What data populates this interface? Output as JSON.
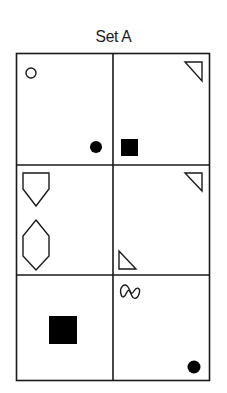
{
  "title": "Set A",
  "grid": {
    "rows": 3,
    "cols": 2,
    "cells": [
      {
        "row": 1,
        "col": 1,
        "shapes": [
          {
            "type": "circle",
            "fill": "outline",
            "position": "top-left"
          },
          {
            "type": "circle",
            "fill": "filled",
            "position": "bottom-right"
          }
        ]
      },
      {
        "row": 1,
        "col": 2,
        "shapes": [
          {
            "type": "right-triangle",
            "fill": "outline",
            "position": "top-right"
          },
          {
            "type": "square",
            "fill": "filled",
            "position": "bottom-left"
          }
        ]
      },
      {
        "row": 2,
        "col": 1,
        "shapes": [
          {
            "type": "pentagon",
            "fill": "outline",
            "position": "top-left"
          },
          {
            "type": "hexagon",
            "fill": "outline",
            "position": "middle-left"
          }
        ]
      },
      {
        "row": 2,
        "col": 2,
        "shapes": [
          {
            "type": "right-triangle",
            "fill": "outline",
            "position": "top-right"
          },
          {
            "type": "right-triangle",
            "fill": "outline",
            "position": "bottom-left"
          }
        ]
      },
      {
        "row": 3,
        "col": 1,
        "shapes": [
          {
            "type": "square",
            "fill": "filled",
            "position": "center"
          }
        ]
      },
      {
        "row": 3,
        "col": 2,
        "shapes": [
          {
            "type": "squiggle",
            "fill": "outline",
            "position": "top-left"
          },
          {
            "type": "circle",
            "fill": "filled",
            "position": "bottom-right"
          }
        ]
      }
    ]
  },
  "colors": {
    "stroke": "#1a1a1a",
    "fill": "#000000",
    "background": "#ffffff"
  }
}
